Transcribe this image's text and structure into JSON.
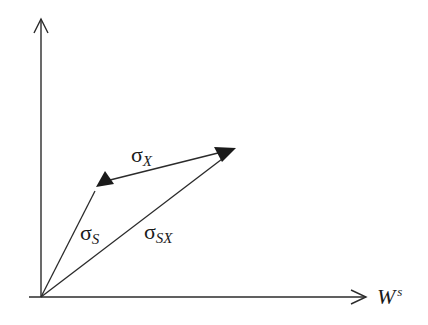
{
  "diagram": {
    "axes": {
      "x_label_main": "W",
      "x_label_sup": "s",
      "y_label": ""
    },
    "vectors": [
      {
        "id": "sigma_s",
        "symbol": "σ",
        "subscript": "S",
        "from": [
          41,
          297
        ],
        "to": [
          100,
          182
        ]
      },
      {
        "id": "sigma_sx",
        "symbol": "σ",
        "subscript": "SX",
        "from": [
          41,
          297
        ],
        "to": [
          236,
          148
        ]
      },
      {
        "id": "sigma_x",
        "symbol": "σ",
        "subscript": "X",
        "from": [
          236,
          148
        ],
        "to": [
          100,
          182
        ]
      }
    ],
    "colors": {
      "stroke": "#2b2b2b",
      "background": "#ffffff"
    }
  }
}
